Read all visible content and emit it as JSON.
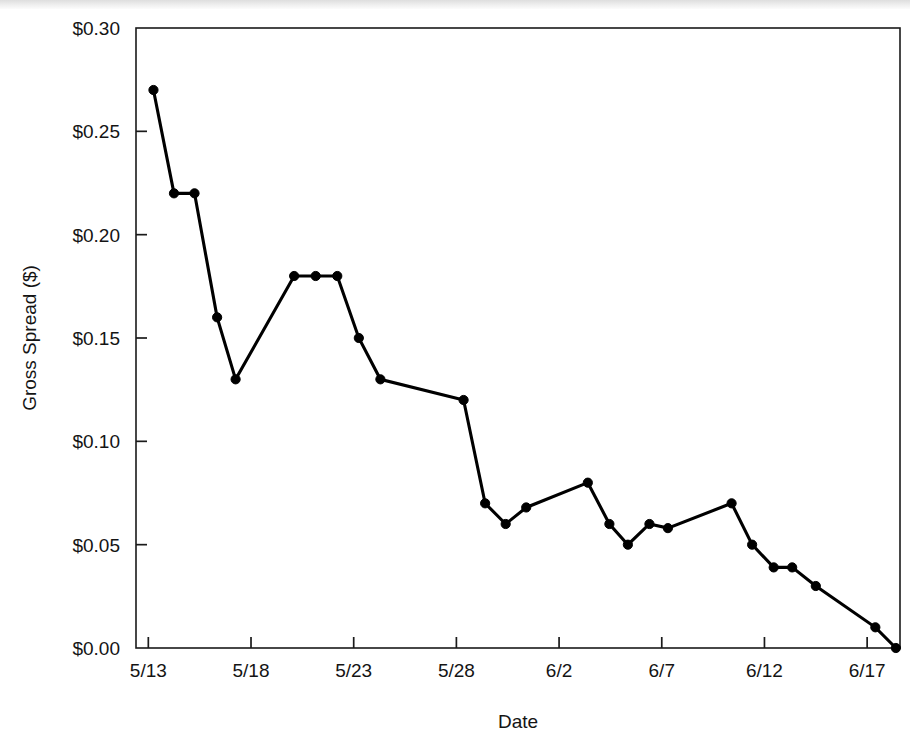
{
  "chart_data": {
    "type": "line",
    "title": "",
    "xlabel": "Date",
    "ylabel": "Gross Spread ($)",
    "ylim": [
      0.0,
      0.3
    ],
    "ytick_values": [
      0.0,
      0.05,
      0.1,
      0.15,
      0.2,
      0.25,
      0.3
    ],
    "ytick_labels": [
      "$0.00",
      "$0.05",
      "$0.10",
      "$0.15",
      "$0.20",
      "$0.25",
      "$0.30"
    ],
    "xtick_labels": [
      "5/13",
      "5/18",
      "5/23",
      "5/28",
      "6/2",
      "6/7",
      "6/12",
      "6/17"
    ],
    "xtick_positions": [
      0,
      5,
      10,
      15,
      20,
      25,
      30,
      35
    ],
    "xlim": [
      -0.6,
      36.6
    ],
    "grid": false,
    "legend": null,
    "marker": "filled-circle",
    "line_color": "#000000",
    "x": [
      0.25,
      1.25,
      2.25,
      3.35,
      4.25,
      7.1,
      8.15,
      9.2,
      10.25,
      11.3,
      15.35,
      16.4,
      17.4,
      18.4,
      21.4,
      22.45,
      23.35,
      24.4,
      25.3,
      28.4,
      29.4,
      30.45,
      31.35,
      32.5,
      35.4,
      36.4
    ],
    "values": [
      0.27,
      0.22,
      0.22,
      0.16,
      0.13,
      0.18,
      0.18,
      0.18,
      0.15,
      0.13,
      0.12,
      0.07,
      0.06,
      0.068,
      0.08,
      0.06,
      0.05,
      0.06,
      0.058,
      0.07,
      0.05,
      0.039,
      0.039,
      0.03,
      0.01,
      0.0
    ],
    "points": [
      {
        "date": "5/13",
        "value": 0.27
      },
      {
        "date": "5/14",
        "value": 0.22
      },
      {
        "date": "5/15",
        "value": 0.22
      },
      {
        "date": "5/16",
        "value": 0.16
      },
      {
        "date": "5/17",
        "value": 0.13
      },
      {
        "date": "5/20",
        "value": 0.18
      },
      {
        "date": "5/21",
        "value": 0.18
      },
      {
        "date": "5/22",
        "value": 0.18
      },
      {
        "date": "5/23",
        "value": 0.15
      },
      {
        "date": "5/24",
        "value": 0.13
      },
      {
        "date": "5/28",
        "value": 0.12
      },
      {
        "date": "5/29",
        "value": 0.07
      },
      {
        "date": "5/30",
        "value": 0.06
      },
      {
        "date": "5/31",
        "value": 0.068
      },
      {
        "date": "6/3",
        "value": 0.08
      },
      {
        "date": "6/4",
        "value": 0.06
      },
      {
        "date": "6/5",
        "value": 0.05
      },
      {
        "date": "6/6",
        "value": 0.06
      },
      {
        "date": "6/7",
        "value": 0.058
      },
      {
        "date": "6/10",
        "value": 0.07
      },
      {
        "date": "6/11",
        "value": 0.05
      },
      {
        "date": "6/12",
        "value": 0.039
      },
      {
        "date": "6/13",
        "value": 0.039
      },
      {
        "date": "6/14",
        "value": 0.03
      },
      {
        "date": "6/17",
        "value": 0.01
      },
      {
        "date": "6/18",
        "value": 0.0
      }
    ]
  }
}
